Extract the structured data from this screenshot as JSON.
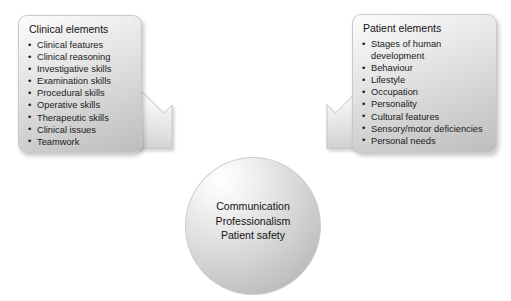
{
  "diagram": {
    "type": "concept-diagram",
    "left_panel": {
      "title": "Clinical elements",
      "items": [
        "Clinical features",
        "Clinical reasoning",
        "Investigative skills",
        "Examination skills",
        "Procedural skills",
        "Operative skills",
        "Therapeutic skills",
        "Clinical issues",
        "Teamwork"
      ]
    },
    "right_panel": {
      "title": "Patient elements",
      "items": [
        "Stages of human development",
        "Behaviour",
        "Lifestyle",
        "Occupation",
        "Personality",
        "Cultural features",
        "Sensory/motor deficiencies",
        "Personal needs"
      ]
    },
    "center": {
      "lines": [
        "Communication",
        "Professionalism",
        "Patient safety"
      ]
    },
    "arrows": [
      {
        "name": "left-arrow",
        "direction": "down-right",
        "from": "Clinical elements",
        "to": "center"
      },
      {
        "name": "right-arrow",
        "direction": "down-left",
        "from": "Patient elements",
        "to": "center"
      }
    ],
    "colors": {
      "panel_light": "#fdfdfd",
      "panel_dark": "#bdbdbd",
      "panel_border": "#c9c9c9",
      "circle_light": "#ffffff",
      "circle_dark": "#b2b2b2",
      "arrow_light": "#ffffff",
      "arrow_dark": "#c6c6c6",
      "text": "#141414",
      "background": "#ffffff"
    }
  }
}
